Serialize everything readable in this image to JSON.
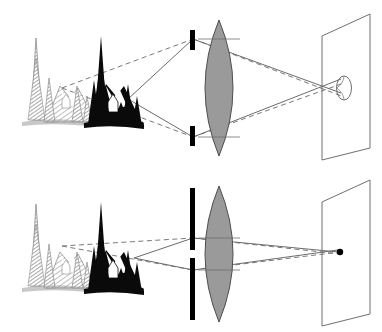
{
  "figure": {
    "domain": "diagram",
    "background_color": "#ffffff",
    "width": 382,
    "height": 332,
    "panel_count": 2,
    "has_text_labels": false
  },
  "palette": {
    "ink": "#000000",
    "lens_fill": "#9a9a9a",
    "lens_stroke": "#4d4d4d",
    "ray_solid": "#6b6b6b",
    "ray_dashed": "#7a7a7a",
    "screen_stroke": "#6f6f6f",
    "stop_bar": "#000000",
    "far_object_gray": "#8c8c8c",
    "near_object_black": "#0a0a0a",
    "blur_circle_stroke": "#6f6f6f",
    "focus_point": "#000000",
    "background": "#ffffff"
  },
  "panels": [
    {
      "id": "wide-aperture",
      "caption": "Wide aperture",
      "aperture": {
        "name": "aperture-stop-wide",
        "type": "two-bar-stop",
        "opening": "large",
        "opening_px": 78,
        "bar_count": 2,
        "bar_width_px": 5,
        "x_px": 192
      },
      "lens": {
        "name": "converging-lens",
        "type": "biconvex",
        "x_px": 219,
        "half_height_px": 68,
        "fill": "#9a9a9a"
      },
      "screen": {
        "name": "image-plane-screen",
        "type": "parallelogram",
        "x_px": 322
      },
      "image_spot": {
        "name": "blur-circle",
        "type": "ellipse",
        "sharp": false,
        "rx_px": 7,
        "ry_px": 12,
        "description": "defocused blur circle beyond the screen"
      },
      "rays": {
        "near_object_rays": "solid",
        "far_object_rays": "dashed",
        "cone_angle": "wide",
        "crossing": "rays cross before reaching the screen producing a large circle of confusion"
      }
    },
    {
      "id": "narrow-aperture",
      "caption": "Narrow aperture",
      "aperture": {
        "name": "aperture-stop-narrow",
        "type": "single-bar-stop",
        "opening": "small",
        "opening_px": 7,
        "bar_count": 1,
        "bar_width_px": 5,
        "x_px": 192
      },
      "lens": {
        "name": "converging-lens",
        "type": "biconvex",
        "x_px": 219,
        "half_height_px": 68,
        "fill": "#9a9a9a"
      },
      "screen": {
        "name": "image-plane-screen",
        "type": "parallelogram",
        "x_px": 322
      },
      "image_spot": {
        "name": "focus-point",
        "type": "point",
        "sharp": true,
        "r_px": 3,
        "description": "sharp point image on the screen"
      },
      "rays": {
        "near_object_rays": "solid",
        "far_object_rays": "dashed",
        "cone_angle": "narrow",
        "crossing": "narrow pencil of rays converges to a sharp point at the screen"
      }
    }
  ],
  "objects": [
    {
      "name": "far-scene",
      "label": "distant mountain scene with conifers and cabin",
      "rendering": "gray hatched outline",
      "color": "#8c8c8c",
      "x_px": 48,
      "distance": "far"
    },
    {
      "name": "near-scene",
      "label": "near mountain scene with conifers and cabin",
      "rendering": "solid black silhouette",
      "color": "#0a0a0a",
      "x_px": 112,
      "distance": "near"
    }
  ]
}
